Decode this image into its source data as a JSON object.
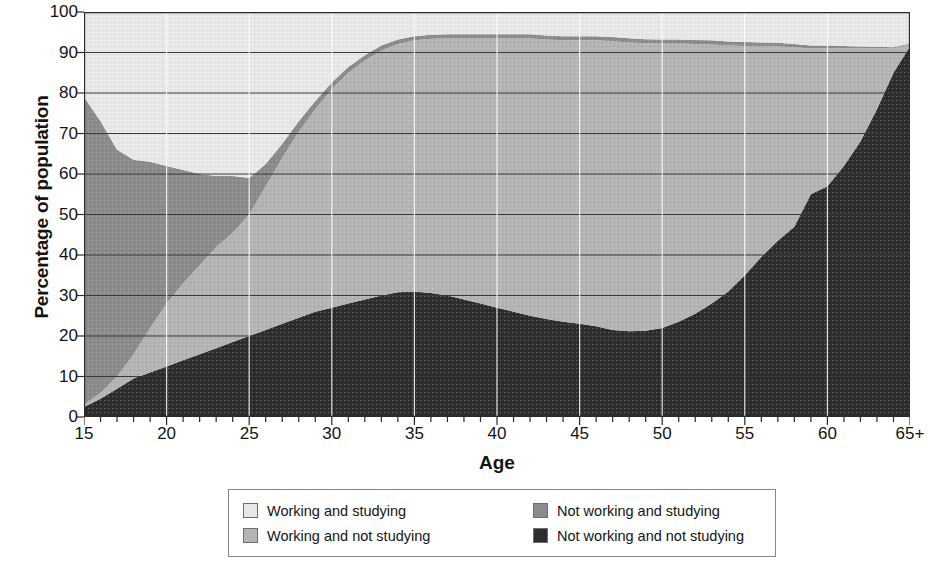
{
  "chart_data": {
    "type": "area",
    "stacked": true,
    "title": "",
    "xlabel": "Age",
    "ylabel": "Percentage of population",
    "xlim": [
      15,
      65
    ],
    "ylim": [
      0,
      100
    ],
    "grid": true,
    "legend_position": "bottom",
    "x": [
      15,
      16,
      17,
      18,
      19,
      20,
      21,
      22,
      23,
      24,
      25,
      26,
      27,
      28,
      29,
      30,
      31,
      32,
      33,
      34,
      35,
      36,
      37,
      38,
      39,
      40,
      41,
      42,
      43,
      44,
      45,
      46,
      47,
      48,
      49,
      50,
      51,
      52,
      53,
      54,
      55,
      56,
      57,
      58,
      59,
      60,
      61,
      62,
      63,
      64,
      65
    ],
    "x_tick_labels": [
      "15",
      "20",
      "25",
      "30",
      "35",
      "40",
      "45",
      "50",
      "55",
      "60",
      "65+"
    ],
    "x_tick_values": [
      15,
      20,
      25,
      30,
      35,
      40,
      45,
      50,
      55,
      60,
      65
    ],
    "y_tick_labels": [
      "0",
      "10",
      "20",
      "30",
      "40",
      "50",
      "60",
      "70",
      "80",
      "90",
      "100"
    ],
    "y_tick_values": [
      0,
      10,
      20,
      30,
      40,
      50,
      60,
      70,
      80,
      90,
      100
    ],
    "stack_order_bottom_to_top": [
      "Not working and not studying",
      "Working and not studying",
      "Not working and studying",
      "Working and studying"
    ],
    "series": [
      {
        "name": "Not working and not studying",
        "color": "#2e2e2e",
        "values": [
          2.5,
          4.5,
          7,
          9.5,
          11,
          12.5,
          14,
          15.5,
          17,
          18.5,
          20,
          21.5,
          23,
          24.5,
          26,
          27,
          28,
          29,
          30,
          30.8,
          31,
          30.6,
          30,
          29,
          28,
          27,
          26,
          25,
          24.2,
          23.5,
          23,
          22.4,
          21.5,
          21.2,
          21.3,
          22,
          23.5,
          25.5,
          28,
          31,
          35,
          39.5,
          43.5,
          47,
          55,
          57,
          62,
          68,
          76,
          85,
          91.5
        ]
      },
      {
        "name": "Working and not studying",
        "color": "#b4b4b4",
        "values": [
          0.5,
          1.5,
          3,
          6,
          11,
          15.5,
          19,
          22,
          25,
          27,
          30,
          35.5,
          41,
          46,
          50,
          54,
          57,
          59,
          60.5,
          61.3,
          62,
          62.8,
          63.5,
          64.5,
          65.5,
          66.5,
          67.5,
          68.5,
          69,
          69.5,
          70,
          70.6,
          71.3,
          71.3,
          71,
          70.2,
          68.7,
          66.6,
          64,
          60.7,
          56.6,
          52,
          48,
          44.3,
          36,
          34,
          29,
          23,
          15,
          6,
          0.5
        ]
      },
      {
        "name": "Not working and studying",
        "color": "#8b8b8b",
        "values": [
          76,
          67,
          56,
          48,
          41,
          34,
          28,
          22.5,
          17.5,
          14,
          9,
          5.5,
          3.5,
          2.5,
          2,
          1.6,
          1.4,
          1.3,
          1.2,
          1.1,
          1,
          1,
          1,
          1,
          1,
          1,
          1,
          1,
          1,
          1,
          1,
          1,
          1,
          1,
          1,
          1,
          1,
          1,
          1,
          1,
          1,
          1,
          0.9,
          0.8,
          0.7,
          0.7,
          0.6,
          0.5,
          0.4,
          0.3,
          0.2
        ]
      },
      {
        "name": "Working and studying",
        "color": "#e8e8e8",
        "values": [
          21,
          27,
          34,
          36.5,
          37,
          38,
          39,
          40,
          40.5,
          40.5,
          41,
          37.5,
          32.5,
          27,
          22,
          17.4,
          13.6,
          10.7,
          8.3,
          6.8,
          6,
          5.6,
          5.5,
          5.5,
          5.5,
          5.5,
          5.5,
          5.5,
          5.8,
          6,
          6,
          6,
          6.2,
          6.5,
          6.7,
          6.8,
          6.8,
          6.9,
          7,
          7.3,
          7.4,
          7.5,
          7.6,
          7.9,
          8.3,
          8.3,
          8.4,
          8.5,
          8.6,
          8.7,
          7.8
        ]
      }
    ]
  },
  "legend": {
    "items": [
      {
        "label": "Working and studying",
        "color": "#e8e8e8"
      },
      {
        "label": "Not working and studying",
        "color": "#8b8b8b"
      },
      {
        "label": "Working and not studying",
        "color": "#b4b4b4"
      },
      {
        "label": "Not working and not studying",
        "color": "#2e2e2e"
      }
    ]
  }
}
